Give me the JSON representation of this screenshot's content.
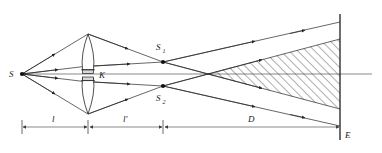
{
  "figure": {
    "type": "optics-ray-diagram",
    "background_color": "#ffffff",
    "line_color": "#252525"
  },
  "labels": {
    "source": "S",
    "stop": "K",
    "image_top": "S",
    "image_top_sub": "1",
    "image_bottom": "S",
    "image_bottom_sub": "2",
    "screen": "E",
    "dim_object": "l",
    "dim_image": "l'",
    "dim_screen": "D"
  },
  "geometry": {
    "source_x": 22,
    "source_y": 74,
    "lens_x": 88,
    "lens_top_apex_y": 34,
    "lens_bottom_apex_y": 114,
    "stop_y": 74,
    "s1_x": 163,
    "s1_y": 62,
    "s2_x": 163,
    "s2_y": 86,
    "screen_x": 340,
    "screen_top_y": 14,
    "screen_bottom_y": 140,
    "axis_y": 74,
    "overlap_start_x": 205,
    "dim_line_y": 127,
    "dim_tick_positions": [
      22,
      88,
      163,
      340
    ]
  },
  "elements": {
    "lens_halves": 2,
    "stop_label_present": true,
    "hatched_overlap_region": true,
    "hatch_angle_deg": 45,
    "arrowheads_on_rays": true
  }
}
